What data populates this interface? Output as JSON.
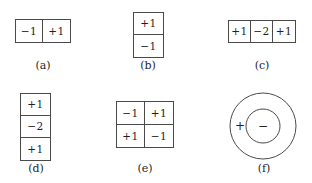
{
  "figure": {
    "panels": [
      {
        "id": "a",
        "label": "(a)",
        "type": "grid",
        "rows": 1,
        "cols": 2,
        "cells": [
          "−1",
          "+1"
        ]
      },
      {
        "id": "b",
        "label": "(b)",
        "type": "grid",
        "rows": 2,
        "cols": 1,
        "cells": [
          "+1",
          "−1"
        ]
      },
      {
        "id": "c",
        "label": "(c)",
        "type": "grid",
        "rows": 1,
        "cols": 3,
        "cells": [
          "+1",
          "−2",
          "+1"
        ]
      },
      {
        "id": "d",
        "label": "(d)",
        "type": "grid",
        "rows": 3,
        "cols": 1,
        "cells": [
          "+1",
          "−2",
          "+1"
        ]
      },
      {
        "id": "e",
        "label": "(e)",
        "type": "grid",
        "rows": 2,
        "cols": 2,
        "cells": [
          "−1",
          "+1",
          "+1",
          "−1"
        ]
      },
      {
        "id": "f",
        "label": "(f)",
        "type": "concentric-circles",
        "outer_sign": "+",
        "inner_sign": "−"
      }
    ]
  },
  "colors": {
    "background": "#ffffff",
    "stroke": "#4a4a4a",
    "text": "#1f1f1f"
  }
}
